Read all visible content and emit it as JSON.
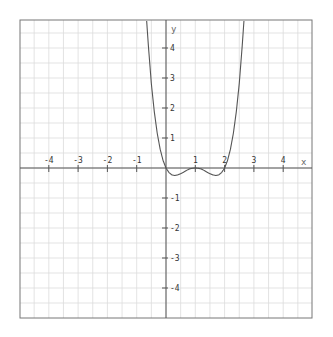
{
  "chart_data": {
    "type": "line",
    "title": "",
    "xlabel": "x",
    "ylabel": "y",
    "xlim": [
      -4.95,
      5.0
    ],
    "ylim": [
      -5.0,
      4.93
    ],
    "grid": true,
    "grid_minor_step": 0.5,
    "x_ticks": [
      -4,
      -3,
      -2,
      -1,
      1,
      2,
      3,
      4
    ],
    "x_tick_labels": [
      "-4",
      "-3",
      "-2",
      "-1",
      "1",
      "2",
      "3",
      "4"
    ],
    "y_ticks": [
      4,
      3,
      2,
      1,
      -1,
      -2,
      -3,
      -4
    ],
    "y_tick_labels": [
      "4",
      "3",
      "2",
      "1",
      "-1",
      "-2",
      "-3",
      "-4"
    ],
    "legend": null,
    "series": [
      {
        "name": "y = x(x-1)^2(x-2)",
        "color": "#555555",
        "x": [
          -0.66,
          -0.6,
          -0.5,
          -0.4,
          -0.3,
          -0.2,
          -0.1,
          0.0,
          0.1,
          0.2,
          0.3,
          0.4,
          0.5,
          0.6,
          0.7,
          0.8,
          0.9,
          1.0,
          1.1,
          1.2,
          1.3,
          1.4,
          1.5,
          1.6,
          1.7,
          1.8,
          1.9,
          2.0,
          2.1,
          2.2,
          2.3,
          2.4,
          2.5,
          2.6,
          2.66
        ],
        "y": [
          4.9,
          4.06,
          2.81,
          1.88,
          1.16,
          0.63,
          0.25,
          0.0,
          -0.15,
          -0.23,
          -0.25,
          -0.23,
          -0.19,
          -0.14,
          -0.08,
          -0.03,
          -0.01,
          0.0,
          -0.01,
          -0.03,
          -0.08,
          -0.14,
          -0.19,
          -0.23,
          -0.25,
          -0.23,
          -0.15,
          0.0,
          0.25,
          0.63,
          1.16,
          1.88,
          2.81,
          4.06,
          4.9
        ]
      }
    ],
    "annotations": [
      {
        "text": "x",
        "position": "right end of x-axis"
      },
      {
        "text": "y",
        "position": "top of y-axis"
      }
    ]
  },
  "axes": {
    "x_name": "x",
    "y_name": "y"
  },
  "colors": {
    "background": "#ffffff",
    "grid": "#dcdcdc",
    "axis": "#555555",
    "frame": "#777777",
    "curve": "#555555"
  }
}
